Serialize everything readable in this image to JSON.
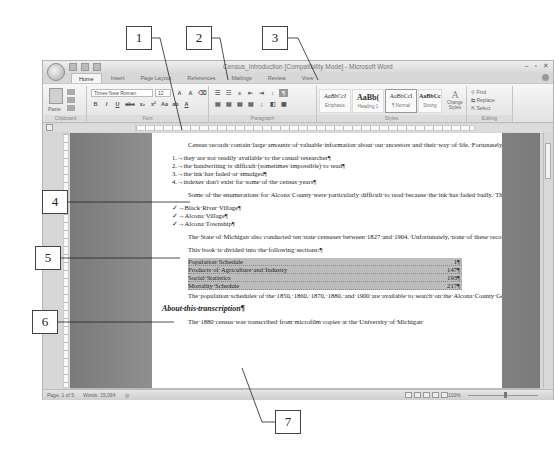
{
  "callouts": [
    "1",
    "2",
    "3",
    "4",
    "5",
    "6",
    "7"
  ],
  "window": {
    "title": "Census_Introduction [Compatibility Mode] - Microsoft Word",
    "controls": [
      "–",
      "▫",
      "✕"
    ]
  },
  "tabs": [
    "Home",
    "Insert",
    "Page Layout",
    "References",
    "Mailings",
    "Review",
    "View"
  ],
  "ribbon": {
    "clipboard": {
      "paste": "Paste",
      "label": "Clipboard"
    },
    "font": {
      "name": "Times New Roman",
      "size": "12",
      "label": "Font",
      "buttons": [
        "B",
        "I",
        "U",
        "abc",
        "x₂",
        "x²",
        "Aa",
        "ab",
        "A"
      ],
      "grow": "A",
      "shrink": "A"
    },
    "paragraph": {
      "label": "Paragraph"
    },
    "styles": {
      "label": "Styles",
      "items": [
        {
          "sample": "AaBbCcI",
          "name": "Emphasis"
        },
        {
          "sample": "AaBb(",
          "name": "Heading 1"
        },
        {
          "sample": "AaBbCcI",
          "name": "¶ Normal"
        },
        {
          "sample": "AaBbCcI",
          "name": "Strong"
        }
      ],
      "change_styles": "Change Styles"
    },
    "editing": {
      "label": "Editing",
      "find": "Find",
      "replace": "Replace",
      "select": "Select"
    }
  },
  "document": {
    "para1": "Census·records·contain·large·amounts·of·valuable·information·about·our·ancestors·and·their·way·of·life.·Fortunately,·most·of·the·actual·census·records·(through·1930)·are·available·on·microfilm.··Some·of·the·original·census·books·can·be·accessed,·if·a·researcher·knows·where·to·look·for·them.·The·problem·with·these·records·is·that:¶",
    "numbered_list": [
      "1.→they·are·not·readily·available·to·the·casual·researcher¶",
      "2.→the·handwriting·is·difficult·(sometimes·impossible)·to·read¶",
      "3.→the·ink·has·faded·or·smudged¶",
      "4.→indexes·don't·exist·for·some·of·the·census·years¶"
    ],
    "para2": "Some·of·the·enumerations·for·Alcona·County·were·particularly·difficult·to·read·because·the·ink·has·faded·badly.·The·most·challenging·were:¶",
    "check_list": [
      "✓→Black·River·Village¶",
      "✓→Alcona·Village¶",
      "✓→Alcona·Township¶"
    ],
    "para3": "The·State·of·Michigan·also·conducted·ten·state·censuses·between·1827·and·1904.·Unfortunately,·none·of·these·records·have·survived·for·Alcona·County.¶",
    "para4": "This·book·is·divided·into·the·following·sections:¶",
    "toc": [
      {
        "title": "Population·Schedule",
        "page": "1¶"
      },
      {
        "title": "Products·of·Agriculture·and·Industry",
        "page": "147¶"
      },
      {
        "title": "Social·Statistics",
        "page": "193¶"
      },
      {
        "title": "Mortality·Schedule",
        "page": "217¶"
      }
    ],
    "para5": "The·population·schedules·of·the·1850,·1860,·1870,·1880,·and·1900·are·available·to·search·on·the·Alcona·County·Genealogical·Society·Web·site.¶",
    "heading": "About·this·transcription¶",
    "para6": "The·1880·census·was·transcribed·from·microfilm·copies·at·the·University·of·Michigan·"
  },
  "statusbar": {
    "page": "Page: 1 of 5",
    "words": "Words: 15,094",
    "zoom": "100%"
  }
}
